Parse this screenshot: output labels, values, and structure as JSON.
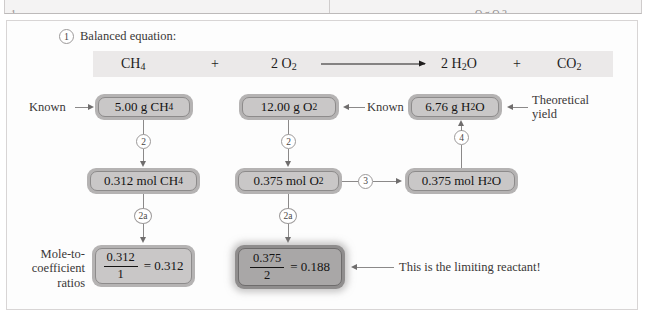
{
  "top_table_strip": {
    "left_cut_text": "1",
    "right_cut_text": "O g O 2"
  },
  "figure": {
    "step1": {
      "number": "1",
      "label": "Balanced equation:"
    },
    "equation": {
      "reactant1": "CH",
      "reactant1_sub": "4",
      "plus1": "+",
      "reactant2_coeff": "2 O",
      "reactant2_sub": "2",
      "arrow": "→",
      "product1_coeff": "2 H",
      "product1_sub": "2",
      "product1_tail": "O",
      "plus2": "+",
      "product2": "CO",
      "product2_sub": "2"
    },
    "nodes": {
      "mass_ch4": {
        "value": "5.00 g CH",
        "sub": "4"
      },
      "mass_o2": {
        "value": "12.00 g O",
        "sub": "2"
      },
      "mass_h2o": {
        "value": "6.76 g H",
        "sub": "2",
        "tail": "O"
      },
      "mol_ch4": {
        "value": "0.312 mol CH",
        "sub": "4"
      },
      "mol_o2": {
        "value": "0.375 mol O",
        "sub": "2"
      },
      "mol_h2o": {
        "value": "0.375 mol H",
        "sub": "2",
        "tail": "O"
      },
      "ratio_ch4": {
        "numerator": "0.312",
        "denominator": "1",
        "equals": "= 0.312"
      },
      "ratio_o2": {
        "numerator": "0.375",
        "denominator": "2",
        "equals": "= 0.188"
      }
    },
    "steps": {
      "step2_left": "2",
      "step2_middle": "2",
      "step3": "3",
      "step4": "4",
      "step2a_left": "2a",
      "step2a_middle": "2a"
    },
    "annotations": {
      "known_left": "Known",
      "known_middle": "Known",
      "theoretical_yield": "Theoretical yield",
      "mole_to_coefficient_ratios": "Mole-to-coefficient ratios",
      "limiting_reactant": "This is the limiting reactant!"
    }
  },
  "colors": {
    "panel_border": "#d8d5d5",
    "equation_band": "#ebe9e9",
    "node_fill": "#c9c7c7",
    "node_frame": "#b5b3b3",
    "highlight_fill": "#a9a7a7",
    "connector": "#8b8989",
    "text": "#1f1d1d"
  }
}
